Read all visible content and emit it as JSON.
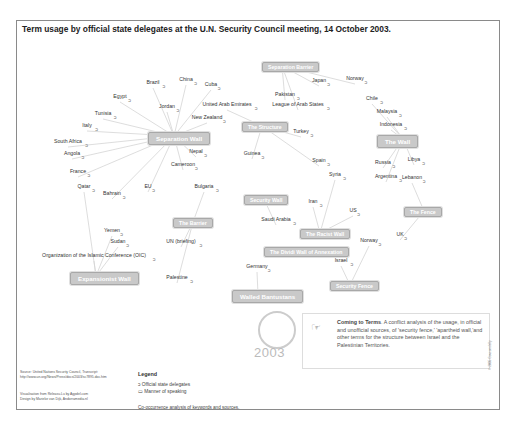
{
  "title": "Term usage by official state delegates at the U.N. Security Council meeting, 14 October 2003.",
  "terms": [
    {
      "id": "sep-wall",
      "label": "Separation Wall",
      "x": 148,
      "y": 132,
      "big": true
    },
    {
      "id": "the-wall",
      "label": "The Wall",
      "x": 377,
      "y": 135,
      "big": true
    },
    {
      "id": "sep-barrier",
      "label": "Separation Barrier",
      "x": 262,
      "y": 62,
      "big": false
    },
    {
      "id": "the-structure",
      "label": "The Structure",
      "x": 242,
      "y": 122,
      "big": false
    },
    {
      "id": "security-wall",
      "label": "Security Wall",
      "x": 244,
      "y": 195,
      "big": false
    },
    {
      "id": "the-barrier",
      "label": "The Barrier",
      "x": 173,
      "y": 218,
      "big": false
    },
    {
      "id": "the-fence",
      "label": "The Fence",
      "x": 404,
      "y": 207,
      "big": false
    },
    {
      "id": "racist-wall",
      "label": "The Racist Wall",
      "x": 300,
      "y": 229,
      "big": false
    },
    {
      "id": "expansionist-wall",
      "label": "Expansionist Wall",
      "x": 70,
      "y": 272,
      "big": true
    },
    {
      "id": "annexation-wall",
      "label": "The Dividi Wall of Annexation",
      "x": 264,
      "y": 247,
      "big": false
    },
    {
      "id": "walled-bantustans",
      "label": "Walled Bantustans",
      "x": 232,
      "y": 290,
      "big": true
    },
    {
      "id": "security-fence",
      "label": "Security Fence",
      "x": 330,
      "y": 281,
      "big": false
    }
  ],
  "delegates": [
    {
      "label": "Brazil",
      "x": 153,
      "y": 82
    },
    {
      "label": "China",
      "x": 186,
      "y": 79
    },
    {
      "label": "Cuba",
      "x": 211,
      "y": 84
    },
    {
      "label": "Egypt",
      "x": 120,
      "y": 96
    },
    {
      "label": "Jordan",
      "x": 167,
      "y": 106
    },
    {
      "label": "United Arab Emirates",
      "x": 227,
      "y": 104
    },
    {
      "label": "Tunisia",
      "x": 103,
      "y": 113
    },
    {
      "label": "New Zealand",
      "x": 207,
      "y": 117
    },
    {
      "label": "Italy",
      "x": 87,
      "y": 125
    },
    {
      "label": "South Africa",
      "x": 68,
      "y": 141
    },
    {
      "label": "Nepal",
      "x": 196,
      "y": 151
    },
    {
      "label": "Angola",
      "x": 72,
      "y": 153
    },
    {
      "label": "Cameroon",
      "x": 183,
      "y": 164
    },
    {
      "label": "France",
      "x": 78,
      "y": 171
    },
    {
      "label": "Qatar",
      "x": 84,
      "y": 186
    },
    {
      "label": "EU",
      "x": 148,
      "y": 186
    },
    {
      "label": "Bahrain",
      "x": 112,
      "y": 193
    },
    {
      "label": "Bulgaria",
      "x": 204,
      "y": 186
    },
    {
      "label": "Guinea",
      "x": 252,
      "y": 153
    },
    {
      "label": "Japan",
      "x": 319,
      "y": 80
    },
    {
      "label": "Norway",
      "x": 355,
      "y": 78
    },
    {
      "label": "Pakistan",
      "x": 285,
      "y": 94
    },
    {
      "label": "League of Arab States",
      "x": 298,
      "y": 104
    },
    {
      "label": "Chile",
      "x": 372,
      "y": 98
    },
    {
      "label": "Malaysia",
      "x": 387,
      "y": 111
    },
    {
      "label": "Turkey",
      "x": 301,
      "y": 131
    },
    {
      "label": "Indonesia",
      "x": 391,
      "y": 124
    },
    {
      "label": "Mexico",
      "x": 394,
      "y": 142
    },
    {
      "label": "Spain",
      "x": 319,
      "y": 160
    },
    {
      "label": "Russia",
      "x": 383,
      "y": 162
    },
    {
      "label": "Libya",
      "x": 414,
      "y": 159
    },
    {
      "label": "Syria",
      "x": 335,
      "y": 174
    },
    {
      "label": "Argentina",
      "x": 386,
      "y": 176
    },
    {
      "label": "Lebanon",
      "x": 412,
      "y": 177
    },
    {
      "label": "US",
      "x": 353,
      "y": 210
    },
    {
      "label": "Iran",
      "x": 313,
      "y": 201
    },
    {
      "label": "Saudi Arabia",
      "x": 276,
      "y": 219
    },
    {
      "label": "Norway",
      "x": 369,
      "y": 240
    },
    {
      "label": "UK",
      "x": 400,
      "y": 234
    },
    {
      "label": "Yemen",
      "x": 112,
      "y": 230
    },
    {
      "label": "Sudan",
      "x": 118,
      "y": 241
    },
    {
      "label": "UN (briefing)",
      "x": 181,
      "y": 241
    },
    {
      "label": "Organization of the Islamic Conference (OIC)",
      "x": 94,
      "y": 255
    },
    {
      "label": "Palestine",
      "x": 177,
      "y": 277
    },
    {
      "label": "Germany",
      "x": 257,
      "y": 266
    },
    {
      "label": "Israel",
      "x": 341,
      "y": 260
    }
  ],
  "info_box": {
    "heading": "Coming to Terms",
    "body": ". A conflict analysis of the usage, in official and unofficial sources, of 'security fence,' 'apartheid wall,'and other terms for the structure between Israel and the Palestinian Territories."
  },
  "un_year": "2003",
  "source": {
    "line1": "Source: United Nations Security Council, Transcript:",
    "line2": "http://www.un.org/News/Press/docs/2003/sc7895.doc.htm",
    "line3": "Visualisation from Releasu.Lu by Agpdel.com",
    "line4": "Design by Marieke van Dijk, Andorramedia.nl"
  },
  "legend": {
    "title": "Legend",
    "items": [
      "Official state delegates",
      "Manner of speaking"
    ],
    "note": "Co-occurrence analysis of keywords and sources."
  },
  "copyright": "© 2005 Govcomdelly"
}
